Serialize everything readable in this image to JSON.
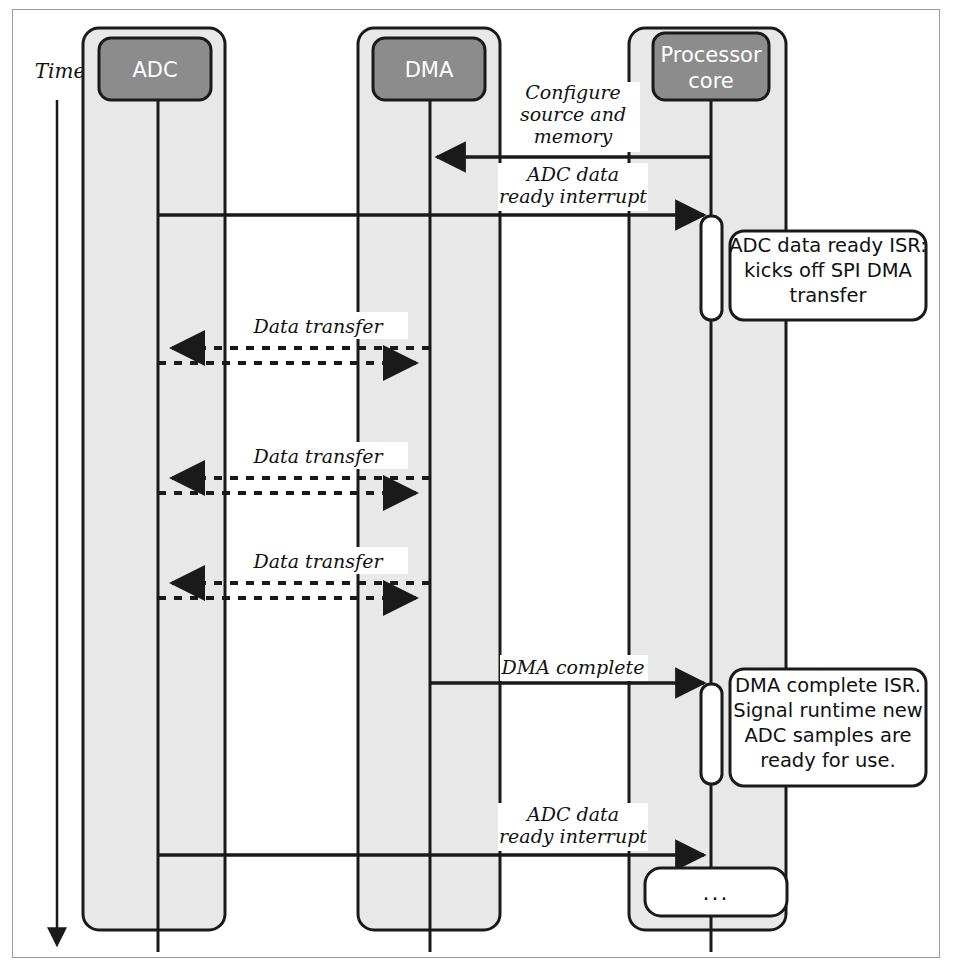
{
  "diagram": {
    "type": "uml-sequence-diagram",
    "time_axis_label": "Time",
    "colors": {
      "lane_fill": "#e8e8e8",
      "header_fill": "#8c8c8c",
      "header_text": "#ffffff",
      "stroke": "#1a1a1a",
      "note_fill": "#ffffff",
      "frame_stroke": "#9a9a9a"
    },
    "participants": [
      {
        "id": "adc",
        "label": "ADC"
      },
      {
        "id": "dma",
        "label": "DMA"
      },
      {
        "id": "cpu",
        "label": "Processor\ncore",
        "label_line1": "Processor",
        "label_line2": "core"
      }
    ],
    "messages": [
      {
        "id": "m1",
        "label": "Configure source and memory",
        "label_lines": [
          "Configure",
          "source and",
          "memory"
        ],
        "from": "cpu",
        "to": "dma",
        "style": "solid",
        "direction": "left"
      },
      {
        "id": "m2",
        "label": "ADC data ready interrupt",
        "label_lines": [
          "ADC data",
          "ready interrupt"
        ],
        "from": "adc",
        "to": "cpu",
        "style": "solid",
        "direction": "right"
      },
      {
        "id": "m3",
        "label": "Data transfer",
        "label_lines": [
          "Data transfer"
        ],
        "from": "dma",
        "to": "adc",
        "style": "dashed",
        "direction": "bidirectional"
      },
      {
        "id": "m4",
        "label": "Data transfer",
        "label_lines": [
          "Data transfer"
        ],
        "from": "dma",
        "to": "adc",
        "style": "dashed",
        "direction": "bidirectional"
      },
      {
        "id": "m5",
        "label": "Data transfer",
        "label_lines": [
          "Data transfer"
        ],
        "from": "dma",
        "to": "adc",
        "style": "dashed",
        "direction": "bidirectional"
      },
      {
        "id": "m6",
        "label": "DMA complete",
        "label_lines": [
          "DMA complete"
        ],
        "from": "dma",
        "to": "cpu",
        "style": "solid",
        "direction": "right"
      },
      {
        "id": "m7",
        "label": "ADC data ready interrupt",
        "label_lines": [
          "ADC data",
          "ready interrupt"
        ],
        "from": "adc",
        "to": "cpu",
        "style": "solid",
        "direction": "right"
      }
    ],
    "notes": [
      {
        "id": "n1",
        "text": "ADC data ready ISR: kicks off SPI DMA transfer",
        "lines": [
          "ADC data ready ISR:",
          "kicks off SPI DMA",
          "transfer"
        ],
        "attached_to": "cpu"
      },
      {
        "id": "n2",
        "text": "DMA complete ISR. Signal runtime new ADC samples are ready for use.",
        "lines": [
          "DMA complete ISR.",
          "Signal runtime new",
          "ADC samples are",
          "ready for use."
        ],
        "attached_to": "cpu"
      }
    ],
    "activations": [
      {
        "id": "a1",
        "participant": "cpu",
        "label": ""
      },
      {
        "id": "a2",
        "participant": "cpu",
        "label": ""
      },
      {
        "id": "a3",
        "participant": "cpu",
        "label": "..."
      }
    ]
  }
}
